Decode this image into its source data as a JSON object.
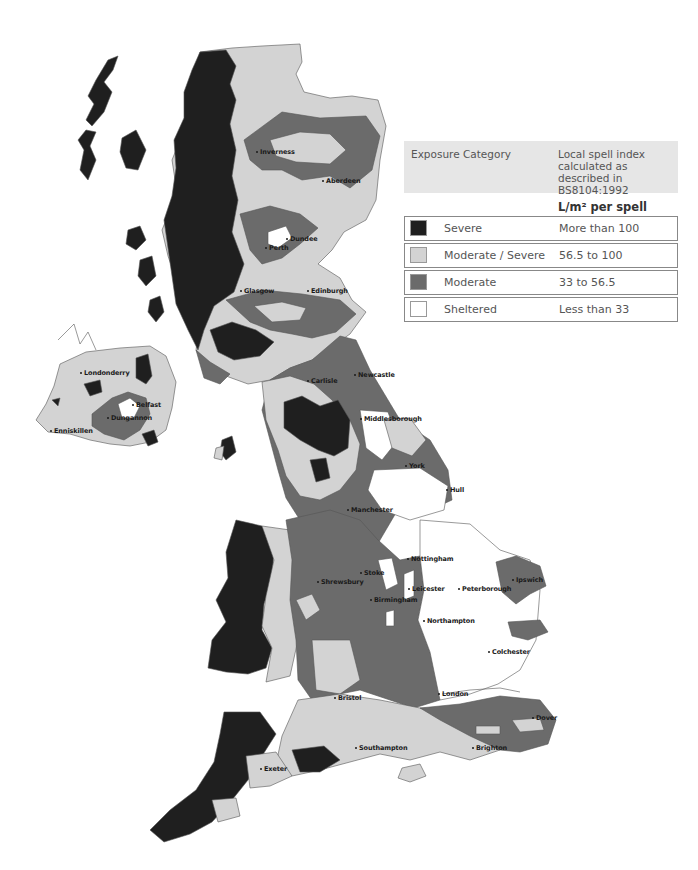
{
  "colors": {
    "severe": "#1f1f1f",
    "moderate_severe": "#d3d3d3",
    "moderate": "#6b6b6b",
    "sheltered": "#ffffff",
    "coast": "#555555"
  },
  "legend": {
    "header_col1": "Exposure Category",
    "header_col2": "Local spell index calculated as described in BS8104:1992",
    "units_label": "L/m² per spell",
    "rows": [
      {
        "category": "Severe",
        "range": "More than 100",
        "color": "#1f1f1f"
      },
      {
        "category": "Moderate / Severe",
        "range": "56.5 to 100",
        "color": "#d3d3d3"
      },
      {
        "category": "Moderate",
        "range": "33 to 56.5",
        "color": "#6b6b6b"
      },
      {
        "category": "Sheltered",
        "range": "Less than 33",
        "color": "#ffffff"
      }
    ]
  },
  "cities": [
    {
      "name": "Inverness",
      "x": 254,
      "y": 152
    },
    {
      "name": "Aberdeen",
      "x": 320,
      "y": 181
    },
    {
      "name": "Dundee",
      "x": 284,
      "y": 239
    },
    {
      "name": "Perth",
      "x": 263,
      "y": 248
    },
    {
      "name": "Glasgow",
      "x": 238,
      "y": 291
    },
    {
      "name": "Edinburgh",
      "x": 305,
      "y": 291
    },
    {
      "name": "Londonderry",
      "x": 78,
      "y": 373
    },
    {
      "name": "Belfast",
      "x": 130,
      "y": 405
    },
    {
      "name": "Dungannon",
      "x": 105,
      "y": 418
    },
    {
      "name": "Enniskillen",
      "x": 48,
      "y": 431
    },
    {
      "name": "Carlisle",
      "x": 305,
      "y": 381
    },
    {
      "name": "Newcastle",
      "x": 352,
      "y": 375
    },
    {
      "name": "Middlesborough",
      "x": 358,
      "y": 419
    },
    {
      "name": "York",
      "x": 403,
      "y": 466
    },
    {
      "name": "Hull",
      "x": 444,
      "y": 490
    },
    {
      "name": "Manchester",
      "x": 345,
      "y": 510
    },
    {
      "name": "Nottingham",
      "x": 405,
      "y": 559
    },
    {
      "name": "Stoke",
      "x": 358,
      "y": 573
    },
    {
      "name": "Shrewsbury",
      "x": 315,
      "y": 582
    },
    {
      "name": "Leicester",
      "x": 406,
      "y": 589
    },
    {
      "name": "Peterborough",
      "x": 456,
      "y": 589
    },
    {
      "name": "Birmingham",
      "x": 368,
      "y": 600
    },
    {
      "name": "Ipswich",
      "x": 510,
      "y": 580
    },
    {
      "name": "Northampton",
      "x": 421,
      "y": 621
    },
    {
      "name": "Colchester",
      "x": 486,
      "y": 652
    },
    {
      "name": "London",
      "x": 436,
      "y": 694
    },
    {
      "name": "Bristol",
      "x": 332,
      "y": 698
    },
    {
      "name": "Dover",
      "x": 530,
      "y": 718
    },
    {
      "name": "Southampton",
      "x": 353,
      "y": 748
    },
    {
      "name": "Brighton",
      "x": 470,
      "y": 748
    },
    {
      "name": "Exeter",
      "x": 258,
      "y": 769
    }
  ]
}
